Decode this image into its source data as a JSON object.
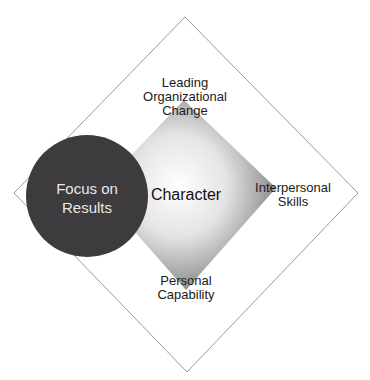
{
  "diagram": {
    "center_label": "Character",
    "circle_label_line1": "Focus on",
    "circle_label_line2": "Results",
    "top_label_line1": "Leading",
    "top_label_line2": "Organizational",
    "top_label_line3": "Change",
    "right_label_line1": "Interpersonal",
    "right_label_line2": "Skills",
    "bottom_label_line1": "Personal",
    "bottom_label_line2": "Capability",
    "colors": {
      "circle": "#3d3b3d",
      "outline": "#9a9a9a",
      "inner_gradient_center": "#ffffff",
      "inner_gradient_edge": "#8a8a8a"
    }
  }
}
